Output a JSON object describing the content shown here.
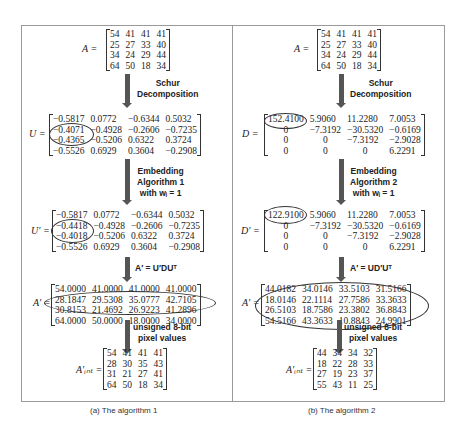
{
  "left_panel": {
    "caption": "(a)  The algorithm 1",
    "A": {
      "label": "A =",
      "rows": [
        [
          "54",
          "41",
          "41",
          "41"
        ],
        [
          "25",
          "27",
          "33",
          "40"
        ],
        [
          "34",
          "24",
          "29",
          "44"
        ],
        [
          "64",
          "50",
          "18",
          "34"
        ]
      ]
    },
    "step1": {
      "line1": "Schur",
      "line2": "Decomposition"
    },
    "U": {
      "label": "U =",
      "rows": [
        [
          "−0.5817",
          "0.0772",
          "−0.6344",
          "0.5032"
        ],
        [
          "−0.4071",
          "−0.4928",
          "−0.2606",
          "−0.7235"
        ],
        [
          "−0.4365",
          "−0.5206",
          "0.6322",
          "0.3724"
        ],
        [
          "−0.5526",
          "0.6929",
          "0.3604",
          "−0.2908"
        ]
      ]
    },
    "step2": {
      "line1": "Embedding",
      "line2": "Algorithm 1",
      "line3": "with wᵢ = 1"
    },
    "U_prime": {
      "label": "U′ =",
      "rows": [
        [
          "−0.5817",
          "0.0772",
          "−0.6344",
          "0.5032"
        ],
        [
          "−0.4418",
          "−0.4928",
          "−0.2606",
          "−0.7235"
        ],
        [
          "−0.4018",
          "−0.5206",
          "0.6322",
          "0.3724"
        ],
        [
          "−0.5526",
          "0.6929",
          "0.3604",
          "−0.2908"
        ]
      ]
    },
    "step3": {
      "formula": "A′ = U′DUᵀ"
    },
    "A_prime": {
      "label": "A′ =",
      "rows": [
        [
          "54.0000",
          "41.0000",
          "41.0000",
          "41.0000"
        ],
        [
          "28.1847",
          "29.5308",
          "35.0777",
          "42.7105"
        ],
        [
          "30.8153",
          "21.4692",
          "26.9223",
          "41.2896"
        ],
        [
          "64.0000",
          "50.0000",
          "18.0000",
          "34.0000"
        ]
      ]
    },
    "step4": {
      "line1": "unsigned 8-bit",
      "line2": "pixel values"
    },
    "A_int": {
      "label": "A′ᵢₙₜ =",
      "rows": [
        [
          "54",
          "41",
          "41",
          "41"
        ],
        [
          "28",
          "30",
          "35",
          "43"
        ],
        [
          "31",
          "21",
          "27",
          "41"
        ],
        [
          "64",
          "50",
          "18",
          "34"
        ]
      ]
    }
  },
  "right_panel": {
    "caption": "(b)  The algorithm 2",
    "A": {
      "label": "A =",
      "rows": [
        [
          "54",
          "41",
          "41",
          "41"
        ],
        [
          "25",
          "27",
          "33",
          "40"
        ],
        [
          "34",
          "24",
          "29",
          "44"
        ],
        [
          "64",
          "50",
          "18",
          "34"
        ]
      ]
    },
    "step1": {
      "line1": "Schur",
      "line2": "Decomposition"
    },
    "D": {
      "label": "D =",
      "rows": [
        [
          "152.4100",
          "5.9060",
          "11.2280",
          "7.0053"
        ],
        [
          "0",
          "−7.3192",
          "−30.5320",
          "−0.6169"
        ],
        [
          "0",
          "0",
          "−7.3192",
          "−2.9028"
        ],
        [
          "0",
          "0",
          "0",
          "6.2291"
        ]
      ]
    },
    "step2": {
      "line1": "Embedding",
      "line2": "Algorithm 2",
      "line3": "with wᵢ = 1"
    },
    "D_prime": {
      "label": "D′ =",
      "rows": [
        [
          "122.9100",
          "5.9060",
          "11.2280",
          "7.0053"
        ],
        [
          "0",
          "−7.3192",
          "−30.5320",
          "−0.6169"
        ],
        [
          "0",
          "0",
          "−7.3192",
          "−2.9028"
        ],
        [
          "0",
          "0",
          "0",
          "6.2291"
        ]
      ]
    },
    "step3": {
      "formula": "A′ = UD′Uᵀ"
    },
    "A_prime": {
      "label": "A′ =",
      "rows": [
        [
          "44.0182",
          "34.0146",
          "33.5103",
          "31.5166"
        ],
        [
          "18.0146",
          "22.1114",
          "27.7586",
          "33.3633"
        ],
        [
          "26.5103",
          "18.7586",
          "23.3802",
          "36.8843"
        ],
        [
          "54.5166",
          "43.3633",
          "10.8843",
          "24.9901"
        ]
      ]
    },
    "step4": {
      "line1": "unsigned 8-bit",
      "line2": "pixel values"
    },
    "A_int": {
      "label": "A′ᵢₙₜ =",
      "rows": [
        [
          "44",
          "34",
          "34",
          "32"
        ],
        [
          "18",
          "22",
          "28",
          "33"
        ],
        [
          "27",
          "19",
          "23",
          "37"
        ],
        [
          "55",
          "43",
          "11",
          "25"
        ]
      ]
    }
  }
}
